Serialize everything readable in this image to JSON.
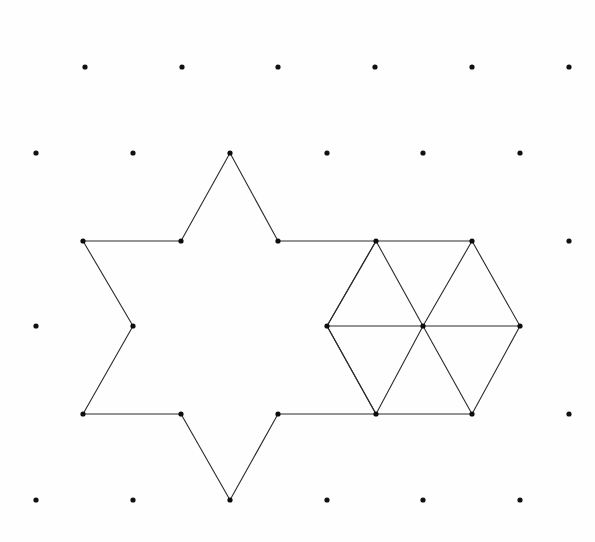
{
  "page": {
    "background_color": "#fefefe",
    "width": 595,
    "height": 542
  },
  "style": {
    "dot_color": "#111111",
    "dot_radius": 2.6,
    "vertex_color": "#0d0d0d",
    "vertex_radius": 2.6,
    "line_color": "#2b2b2b",
    "line_width": 1.1
  },
  "chart_data": {
    "type": "scatter",
    "title": "",
    "xlabel": "",
    "ylabel": "",
    "grid": "triangular-lattice",
    "xlim": [
      0,
      595
    ],
    "ylim": [
      0,
      542
    ],
    "lattice": {
      "rows": [
        {
          "y": 67,
          "x": [
            85,
            182,
            278,
            375,
            472,
            569
          ]
        },
        {
          "y": 153,
          "x": [
            36,
            133,
            230,
            327,
            423,
            520
          ]
        },
        {
          "y": 241,
          "x": [
            83,
            181,
            278,
            376,
            472,
            569
          ]
        },
        {
          "y": 326,
          "x": [
            36,
            133,
            230,
            327,
            423,
            520
          ]
        },
        {
          "y": 414,
          "x": [
            83,
            181,
            278,
            376,
            472,
            569
          ]
        },
        {
          "y": 500,
          "x": [
            36,
            133,
            230,
            327,
            423,
            520
          ]
        }
      ],
      "spacing_x": 96.6,
      "spacing_y": 86.5,
      "visible_dots": [
        [
          85,
          67
        ],
        [
          182,
          67
        ],
        [
          278,
          67
        ],
        [
          375,
          67
        ],
        [
          472,
          67
        ],
        [
          569,
          67
        ],
        [
          36,
          153
        ],
        [
          133,
          153
        ],
        [
          327,
          153
        ],
        [
          423,
          153
        ],
        [
          520,
          153
        ],
        [
          569,
          241
        ],
        [
          36,
          326
        ],
        [
          569,
          414
        ],
        [
          36,
          500
        ],
        [
          133,
          500
        ],
        [
          327,
          500
        ],
        [
          423,
          500
        ],
        [
          520,
          500
        ]
      ]
    },
    "figures": [
      {
        "name": "six-pointed-star",
        "closed": true,
        "vertices": [
          [
            230,
            153
          ],
          [
            278,
            241
          ],
          [
            376,
            241
          ],
          [
            327,
            326
          ],
          [
            376,
            414
          ],
          [
            278,
            414
          ],
          [
            230,
            500
          ],
          [
            181,
            414
          ],
          [
            83,
            414
          ],
          [
            133,
            326
          ],
          [
            83,
            241
          ],
          [
            181,
            241
          ]
        ],
        "interior_edges": []
      },
      {
        "name": "triangulated-hexagon",
        "closed": true,
        "vertices": [
          [
            376,
            241
          ],
          [
            472,
            241
          ],
          [
            520,
            326
          ],
          [
            472,
            414
          ],
          [
            376,
            414
          ],
          [
            327,
            326
          ]
        ],
        "center": [
          423,
          326
        ],
        "interior_edges": [
          [
            [
              327,
              326
            ],
            [
              520,
              326
            ]
          ],
          [
            [
              423,
              326
            ],
            [
              376,
              241
            ]
          ],
          [
            [
              423,
              326
            ],
            [
              472,
              241
            ]
          ],
          [
            [
              423,
              326
            ],
            [
              376,
              414
            ]
          ],
          [
            [
              423,
              326
            ],
            [
              472,
              414
            ]
          ]
        ]
      }
    ],
    "marked_vertices": [
      [
        230,
        153
      ],
      [
        83,
        241
      ],
      [
        181,
        241
      ],
      [
        278,
        241
      ],
      [
        376,
        241
      ],
      [
        472,
        241
      ],
      [
        133,
        326
      ],
      [
        327,
        326
      ],
      [
        423,
        326
      ],
      [
        520,
        326
      ],
      [
        83,
        414
      ],
      [
        181,
        414
      ],
      [
        278,
        414
      ],
      [
        376,
        414
      ],
      [
        472,
        414
      ],
      [
        230,
        500
      ]
    ]
  }
}
